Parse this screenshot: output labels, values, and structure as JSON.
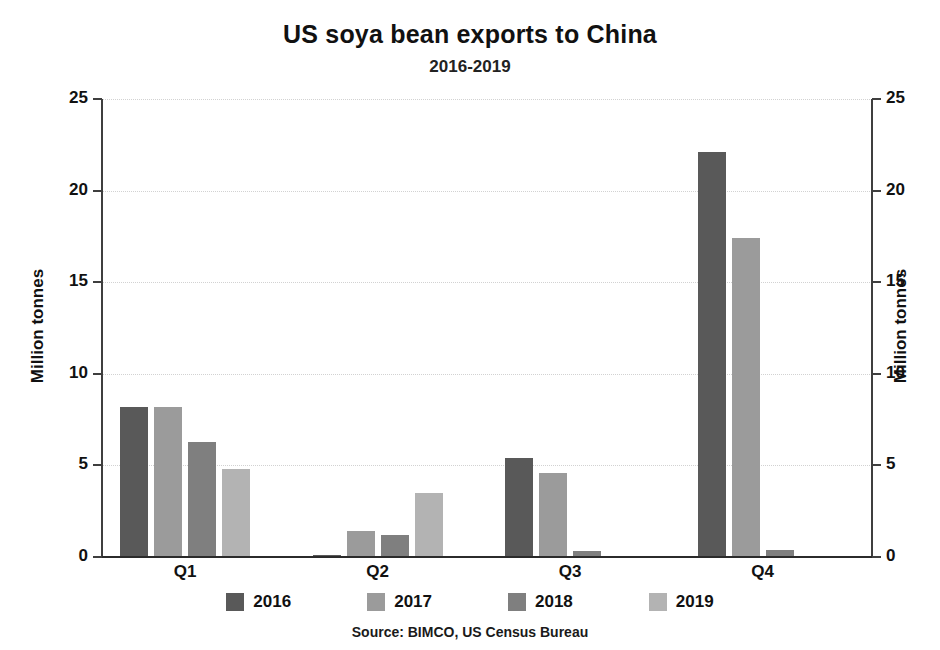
{
  "chart_data": {
    "type": "bar",
    "title": "US soya bean exports to China",
    "subtitle": "2016-2019",
    "xlabel": "",
    "ylabel": "Million tonnes",
    "ylabel_right": "Million tonnes",
    "categories": [
      "Q1",
      "Q2",
      "Q3",
      "Q4"
    ],
    "series": [
      {
        "name": "2016",
        "color": "#595959",
        "values": [
          8.2,
          0.1,
          5.4,
          22.1
        ]
      },
      {
        "name": "2017",
        "color": "#9b9b9b",
        "values": [
          8.2,
          1.4,
          4.6,
          17.4
        ]
      },
      {
        "name": "2018",
        "color": "#7f7f7f",
        "values": [
          6.3,
          1.2,
          0.35,
          0.4
        ]
      },
      {
        "name": "2019",
        "color": "#b3b3b3",
        "values": [
          4.8,
          3.5,
          0.0,
          0.0
        ]
      }
    ],
    "ylim": [
      0,
      25
    ],
    "yticks": [
      0,
      5,
      10,
      15,
      20,
      25
    ],
    "ytick_labels": [
      "0",
      "5",
      "10",
      "15",
      "20",
      "25"
    ],
    "grid": true,
    "grid_color": "#d2d2d2",
    "legend_position": "bottom",
    "source": "Source: BIMCO, US Census Bureau",
    "axis_color": "#3f3f3f",
    "background": "#ffffff"
  }
}
